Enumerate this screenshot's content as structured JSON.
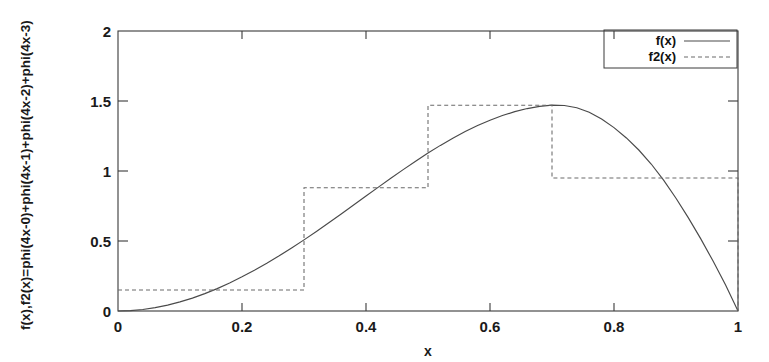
{
  "chart_data": {
    "type": "line",
    "title": "",
    "xlabel": "x",
    "ylabel": "f(x),f2(x)=phi(4x-0)+phi(4x-1)+phi(4x-2)+phi(4x-3)",
    "xlim": [
      0,
      1
    ],
    "ylim": [
      0,
      2
    ],
    "xticks": [
      0,
      0.2,
      0.4,
      0.6,
      0.8,
      1
    ],
    "xtick_labels": [
      "0",
      "0.2",
      "0.4",
      "0.6",
      "0.8",
      "1"
    ],
    "yticks": [
      0,
      0.5,
      1,
      1.5,
      2
    ],
    "ytick_labels": [
      "0",
      "0.5",
      "1",
      "1.5",
      "2"
    ],
    "grid": false,
    "legend_position": "top-right",
    "legend_entries": [
      {
        "label": "f(x)",
        "style": "solid"
      },
      {
        "label": "f2(x)",
        "style": "dashed"
      }
    ],
    "series": [
      {
        "name": "f(x)",
        "style": "solid",
        "x": [
          0.0,
          0.02,
          0.04,
          0.06,
          0.08,
          0.1,
          0.12,
          0.14,
          0.16,
          0.18,
          0.2,
          0.22,
          0.24,
          0.26,
          0.28,
          0.3,
          0.32,
          0.34,
          0.36,
          0.38,
          0.4,
          0.42,
          0.44,
          0.46,
          0.48,
          0.5,
          0.52,
          0.54,
          0.56,
          0.58,
          0.6,
          0.62,
          0.64,
          0.66,
          0.68,
          0.7,
          0.72,
          0.74,
          0.76,
          0.78,
          0.8,
          0.82,
          0.84,
          0.86,
          0.88,
          0.9,
          0.92,
          0.94,
          0.96,
          0.98,
          1.0
        ],
        "y": [
          0.0,
          0.003,
          0.011,
          0.024,
          0.042,
          0.065,
          0.092,
          0.124,
          0.16,
          0.2,
          0.244,
          0.291,
          0.341,
          0.394,
          0.45,
          0.508,
          0.568,
          0.63,
          0.693,
          0.757,
          0.821,
          0.885,
          0.948,
          1.01,
          1.07,
          1.128,
          1.183,
          1.234,
          1.282,
          1.325,
          1.363,
          1.396,
          1.424,
          1.446,
          1.462,
          1.47,
          1.468,
          1.452,
          1.42,
          1.372,
          1.31,
          1.236,
          1.15,
          1.05,
          0.935,
          0.805,
          0.665,
          0.515,
          0.355,
          0.185,
          0.0
        ]
      },
      {
        "name": "f2(x)",
        "style": "dashed",
        "description": "piecewise-constant step approximation",
        "steps": [
          {
            "x_start": 0.0,
            "x_end": 0.3,
            "value": 0.15
          },
          {
            "x_start": 0.3,
            "x_end": 0.5,
            "value": 0.88
          },
          {
            "x_start": 0.5,
            "x_end": 0.7,
            "value": 1.47
          },
          {
            "x_start": 0.7,
            "x_end": 1.0,
            "value": 0.95
          }
        ],
        "drops_to_zero_at_x": 1.0
      }
    ]
  },
  "axes": {
    "xlabel": "x",
    "ylabel": "f(x),f2(x)=phi(4x-0)+phi(4x-1)+phi(4x-2)+phi(4x-3)"
  }
}
